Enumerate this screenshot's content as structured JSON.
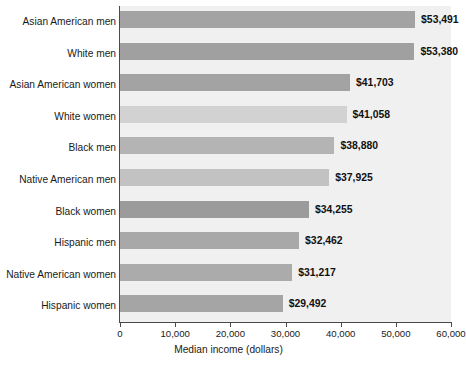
{
  "chart_data": {
    "type": "bar",
    "orientation": "horizontal",
    "title": "",
    "xlabel": "Median income (dollars)",
    "ylabel": "",
    "xlim": [
      0,
      60000
    ],
    "xticks": [
      0,
      10000,
      20000,
      30000,
      40000,
      50000,
      60000
    ],
    "xtick_labels": [
      "0",
      "10,000",
      "20,000",
      "30,000",
      "40,000",
      "50,000",
      "60,000"
    ],
    "grid": false,
    "legend": false,
    "categories": [
      "Asian American men",
      "White men",
      "Asian American women",
      "White women",
      "Black men",
      "Native American men",
      "Black women",
      "Hispanic men",
      "Native American women",
      "Hispanic women"
    ],
    "values": [
      53491,
      53380,
      41703,
      41058,
      38880,
      37925,
      34255,
      32462,
      31217,
      29492
    ],
    "value_labels": [
      "$53,491",
      "$53,380",
      "$41,703",
      "$41,058",
      "$38,880",
      "$37,925",
      "$34,255",
      "$32,462",
      "$31,217",
      "$29,492"
    ],
    "bar_colors": [
      "#a3a3a3",
      "#a0a0a0",
      "#a3a3a3",
      "#d2d2d2",
      "#b4b4b4",
      "#c2c2c2",
      "#9b9b9b",
      "#a8a8a8",
      "#ababab",
      "#a5a5a5"
    ],
    "plot_background": "#f0f0f0",
    "axis_color": "#4a4a4a",
    "text_color": "#1a1a1a"
  }
}
